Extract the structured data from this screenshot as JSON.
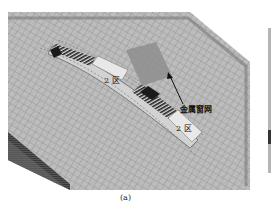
{
  "figure": {
    "panel_label": "(a)",
    "annotations": {
      "zone_upper": "2 区",
      "zone_lower": "2 区",
      "pointer_label": "金属窗网"
    },
    "colors": {
      "mesh_fill": "#bdbdbd",
      "mesh_line": "#8a8a8a",
      "edge_dark": "#2a2a2a",
      "zone_fill": "#e6e6e6",
      "arrow": "#111111"
    }
  }
}
